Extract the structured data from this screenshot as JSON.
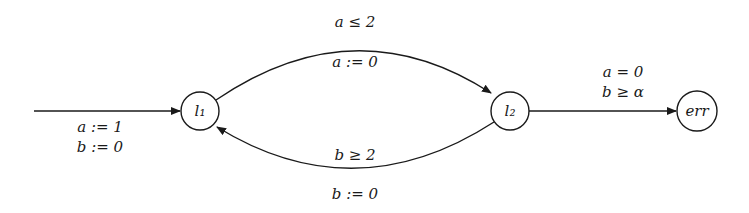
{
  "diagram": {
    "type": "timed-automaton",
    "nodes": [
      {
        "id": "l1",
        "label": "l₁",
        "cx": 200,
        "cy": 111,
        "r": 19
      },
      {
        "id": "l2",
        "label": "l₂",
        "cx": 510,
        "cy": 111,
        "r": 19
      },
      {
        "id": "err",
        "label": "err",
        "cx": 697,
        "cy": 111,
        "r": 20
      }
    ],
    "edges": [
      {
        "id": "init",
        "from": null,
        "to": "l1",
        "guard": "",
        "reset": [
          "a := 1",
          "b := 0"
        ]
      },
      {
        "id": "l1-l2",
        "from": "l1",
        "to": "l2",
        "guard": "a ≤ 2",
        "reset": "a := 0"
      },
      {
        "id": "l2-l1",
        "from": "l2",
        "to": "l1",
        "guard": "b ≥ 2",
        "reset": "b := 0"
      },
      {
        "id": "l2-err",
        "from": "l2",
        "to": "err",
        "guard": [
          "a = 0",
          "b ≥ α"
        ]
      }
    ]
  },
  "labels": {
    "init_reset_a": "a := 1",
    "init_reset_b": "b := 0",
    "top_guard": "a ≤ 2",
    "top_reset": "a := 0",
    "bottom_guard": "b ≥ 2",
    "bottom_reset": "b := 0",
    "err_guard_a": "a = 0",
    "err_guard_b": "b ≥ α",
    "node_l1": "l₁",
    "node_l2": "l₂",
    "node_err": "err"
  }
}
